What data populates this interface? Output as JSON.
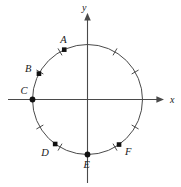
{
  "figure": {
    "kind": "unit-circle-diagram",
    "background_color": "#ffffff",
    "stroke_color": "#4a4a4a",
    "point_color": "#111111",
    "text_color": "#1a1a1a"
  },
  "axes": {
    "x": {
      "label": "x",
      "label_pos": {
        "x": 170,
        "y": 95
      },
      "line": {
        "x1": 8,
        "y1": 99.5,
        "x2": 163,
        "y2": 99.5
      },
      "arrow_at": "right"
    },
    "y": {
      "label": "y",
      "label_pos": {
        "x": 82,
        "y": 3
      },
      "line": {
        "x1": 87.5,
        "y1": 183,
        "x2": 87.5,
        "y2": 14
      },
      "arrow_at": "top"
    }
  },
  "circle": {
    "cx": 87.5,
    "cy": 99.5,
    "r": 55,
    "stroke_width": 1.0
  },
  "ticks": {
    "count": 12,
    "step_degrees": 30,
    "start_degrees": 0,
    "length": 8,
    "stroke_width": 1.0,
    "angles": [
      0,
      30,
      60,
      90,
      120,
      150,
      180,
      210,
      240,
      270,
      300,
      330
    ],
    "hidden_angles": [
      0,
      90,
      180,
      270
    ]
  },
  "points": [
    {
      "id": "A",
      "label": "A",
      "angle": 115,
      "label_dx": -4,
      "label_dy": -15,
      "marker": "square"
    },
    {
      "id": "B",
      "label": "B",
      "angle": 152,
      "label_dx": -14,
      "label_dy": -10,
      "marker": "square"
    },
    {
      "id": "C",
      "label": "C",
      "angle": 180,
      "label_dx": -12,
      "label_dy": -14,
      "marker": "circle"
    },
    {
      "id": "D",
      "label": "D",
      "angle": 234,
      "label_dx": -14,
      "label_dy": 4,
      "marker": "square"
    },
    {
      "id": "E",
      "label": "E",
      "angle": 270,
      "label_dx": -4,
      "label_dy": 5,
      "marker": "circle"
    },
    {
      "id": "F",
      "label": "F",
      "angle": 305,
      "label_dx": 6,
      "label_dy": 2,
      "marker": "square"
    }
  ]
}
